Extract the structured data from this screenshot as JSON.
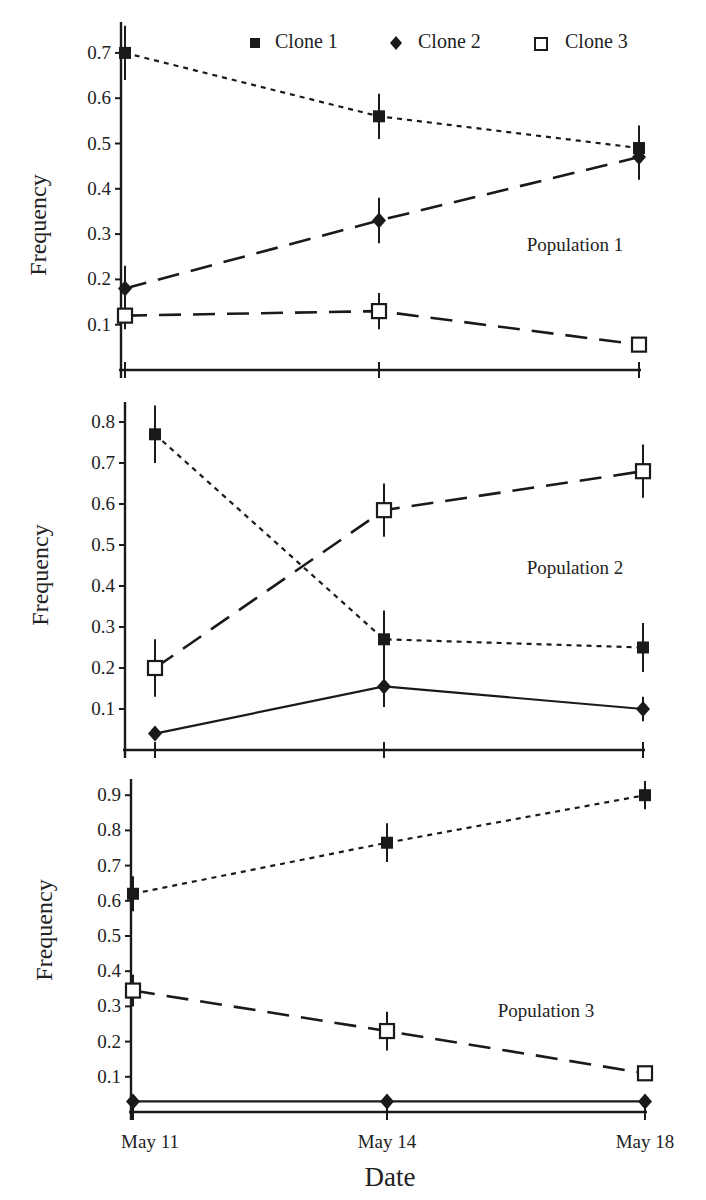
{
  "chart_data": [
    {
      "type": "line",
      "panel": "Population 1",
      "annotation": "Population 1",
      "categories": [
        "May 11",
        "May 14",
        "May 18"
      ],
      "ylabel": "Frequency",
      "xlabel": "",
      "yticks": [
        0.1,
        0.2,
        0.3,
        0.4,
        0.5,
        0.6,
        0.7
      ],
      "ylim": [
        0,
        0.7
      ],
      "grid": false,
      "series": [
        {
          "name": "Clone 1",
          "values": [
            0.7,
            0.56,
            0.49
          ],
          "errors": [
            0.06,
            0.05,
            0.05
          ]
        },
        {
          "name": "Clone 2",
          "values": [
            0.18,
            0.33,
            0.47
          ],
          "errors": [
            0.05,
            0.05,
            0.05
          ]
        },
        {
          "name": "Clone 3",
          "values": [
            0.12,
            0.13,
            0.056
          ],
          "errors": [
            0.03,
            0.04,
            0.01
          ]
        }
      ]
    },
    {
      "type": "line",
      "panel": "Population 2",
      "annotation": "Population 2",
      "categories": [
        "May 11",
        "May 14",
        "May 18"
      ],
      "ylabel": "Frequency",
      "xlabel": "",
      "yticks": [
        0.1,
        0.2,
        0.3,
        0.4,
        0.5,
        0.6,
        0.7,
        0.8
      ],
      "ylim": [
        0,
        0.8
      ],
      "grid": false,
      "series": [
        {
          "name": "Clone 1",
          "values": [
            0.77,
            0.27,
            0.25
          ],
          "errors": [
            0.07,
            0.07,
            0.06
          ]
        },
        {
          "name": "Clone 2",
          "values": [
            0.04,
            0.155,
            0.1
          ],
          "errors": [
            0.005,
            0.05,
            0.03
          ]
        },
        {
          "name": "Clone 3",
          "values": [
            0.2,
            0.585,
            0.68
          ],
          "errors": [
            0.07,
            0.065,
            0.065
          ]
        }
      ]
    },
    {
      "type": "line",
      "panel": "Population 3",
      "annotation": "Population 3",
      "categories": [
        "May 11",
        "May 14",
        "May 18"
      ],
      "ylabel": "Frequency",
      "xlabel": "Date",
      "yticks": [
        0.1,
        0.2,
        0.3,
        0.4,
        0.5,
        0.6,
        0.7,
        0.8,
        0.9
      ],
      "ylim": [
        0,
        0.9
      ],
      "grid": false,
      "series": [
        {
          "name": "Clone 1",
          "values": [
            0.62,
            0.765,
            0.9
          ],
          "errors": [
            0.05,
            0.055,
            0.04
          ]
        },
        {
          "name": "Clone 2",
          "values": [
            0.03,
            0.03,
            0.03
          ],
          "errors": [
            0.005,
            0.005,
            0.005
          ]
        },
        {
          "name": "Clone 3",
          "values": [
            0.345,
            0.23,
            0.11
          ],
          "errors": [
            0.045,
            0.055,
            0.01
          ]
        }
      ]
    }
  ],
  "legend": {
    "position": "top-right",
    "entries": [
      {
        "label": "Clone 1",
        "marker": "filled-square"
      },
      {
        "label": "Clone 2",
        "marker": "filled-diamond"
      },
      {
        "label": "Clone 3",
        "marker": "open-square"
      }
    ]
  },
  "styles": {
    "Clone 1": {
      "dash": "5,5",
      "width": 2.2
    },
    "Clone 2_p1": {
      "dash": "22,12",
      "width": 2.6
    },
    "Clone 2": {
      "dash": "",
      "width": 2.2
    },
    "Clone 3": {
      "dash": "22,12",
      "width": 2.6
    },
    "color": "#1a1a1a"
  },
  "x_axis": {
    "label": "Date",
    "ticks": [
      "May 11",
      "May 14",
      "May 18"
    ]
  }
}
